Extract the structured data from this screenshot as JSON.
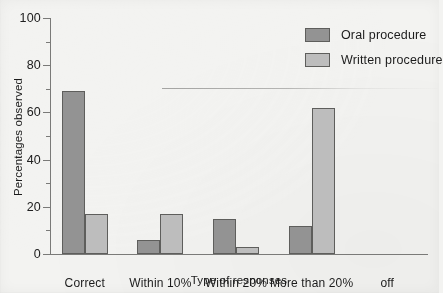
{
  "chart_data": {
    "type": "bar",
    "title": "",
    "xlabel": "Type of responses",
    "ylabel": "Percentages observed",
    "categories": [
      "Correct",
      "Within 10%",
      "Within 20%",
      "More than 20%",
      "off"
    ],
    "series": [
      {
        "name": "Oral procedure",
        "color": "#939393",
        "values": [
          69,
          6,
          15,
          12,
          null
        ]
      },
      {
        "name": "Written procedure",
        "color": "#bdbdbd",
        "values": [
          17,
          17,
          3,
          62,
          null
        ]
      }
    ],
    "ylim": [
      0,
      100
    ],
    "yticks": [
      0,
      20,
      40,
      60,
      80,
      100
    ],
    "yticklabels": [
      "0",
      "20",
      "40",
      "60",
      "80",
      "100"
    ],
    "yminorticks": [
      10,
      30,
      50,
      70,
      90
    ],
    "grid": false,
    "legend_position": "top-right"
  },
  "axis": {
    "ylabel": "Percentages observed",
    "xlabel": "Type of responses"
  },
  "legend": {
    "items": [
      {
        "label": "Oral procedure",
        "color": "#939393"
      },
      {
        "label": "Written procedure",
        "color": "#bdbdbd"
      }
    ]
  },
  "colors": {
    "oral": "#939393",
    "written": "#bdbdbd",
    "bar_outline": "#5e5e5c",
    "axis": "#7a7a78",
    "background": "#f3f3f1"
  }
}
